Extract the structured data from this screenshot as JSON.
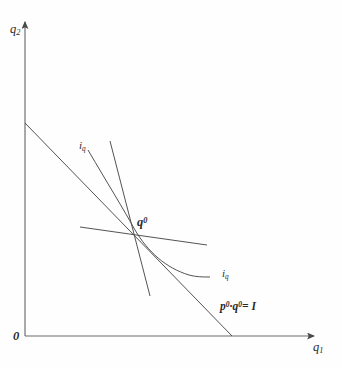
{
  "figure": {
    "kind": "consumer-equilibrium-diagram",
    "background_color": "#fefefe",
    "line_color": "#4a4a4a",
    "text_color": "#2b2b2b"
  },
  "axes": {
    "y_label": "q",
    "y_label_sub": "2",
    "x_label": "q",
    "x_label_sub": "1",
    "origin_label": "0",
    "x_axis": {
      "from": [
        25,
        336
      ],
      "to": [
        318,
        336
      ]
    },
    "y_axis": {
      "from": [
        25,
        336
      ],
      "to": [
        25,
        20
      ]
    }
  },
  "point": {
    "label": "q",
    "label_sup": "0",
    "x": 135,
    "y": 230
  },
  "budget_line": {
    "label_p": "p",
    "label_p_sup": "0",
    "label_dot": "·",
    "label_q": "q",
    "label_q_sup": "0",
    "label_rhs": "= I",
    "from": [
      25,
      123
    ],
    "to": [
      232,
      336
    ]
  },
  "indifference_curve": {
    "label_upper": "i",
    "label_upper_sub": "q",
    "label_lower": "i",
    "label_lower_sub": "q",
    "path": "M 88 150 C 108 184, 124 210, 135 230 C 148 252, 166 268, 189 275 C 196 277, 203 277, 210 277"
  },
  "steep_line": {
    "from": [
      110,
      141
    ],
    "to": [
      150,
      296
    ]
  },
  "shallow_line": {
    "from": [
      80,
      227
    ],
    "to": [
      207,
      245
    ]
  }
}
